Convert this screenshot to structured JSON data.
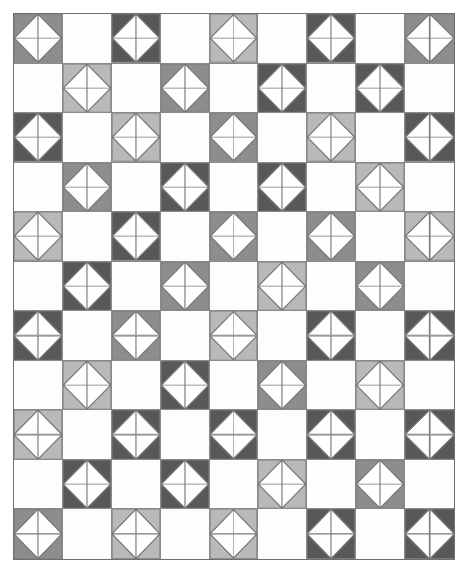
{
  "artwork": {
    "title": "Patchwork quilt pattern",
    "description": "Checkerboard layout of half-square-triangle quilt blocks forming white diamonds on a grid",
    "canvas": {
      "width": 467,
      "height": 572,
      "background": "#ffffff"
    }
  },
  "frame": {
    "x": 13,
    "y": 13,
    "width": 442,
    "height": 547,
    "border_color": "#6f6f6f",
    "fill": "#fdfdfc"
  },
  "grid": {
    "columns": 9,
    "rows": 11,
    "line_color": "#8a8a8a",
    "cell_fill": "#fdfdfc"
  },
  "palette": {
    "dark": "#585858",
    "medium": "#8d8d8d",
    "light": "#b9b9b9",
    "white": "#fefefe",
    "outline": "#7a7a7a"
  },
  "block_design": {
    "name": "half-square-triangle diamond block",
    "quadrants": 4,
    "corner_triangle_colored": true,
    "center_shape": "white diamond"
  },
  "chart_data": {
    "type": "heatmap",
    "xlabel": "",
    "ylabel": "",
    "columns": 9,
    "rows": 11,
    "legend": [
      "dark",
      "medium",
      "light",
      "empty"
    ],
    "note": "Each value is the shade key of the quilt block in that cell; empty cells are plain white squares.",
    "cells": [
      [
        "medium",
        "",
        "dark",
        "",
        "light",
        "",
        "dark",
        "",
        "medium"
      ],
      [
        "",
        "light",
        "",
        "medium",
        "",
        "dark",
        "",
        "dark",
        ""
      ],
      [
        "dark",
        "",
        "light",
        "",
        "medium",
        "",
        "light",
        "",
        "dark"
      ],
      [
        "",
        "medium",
        "",
        "dark",
        "",
        "dark",
        "",
        "light",
        ""
      ],
      [
        "light",
        "",
        "dark",
        "",
        "medium",
        "",
        "medium",
        "",
        "light"
      ],
      [
        "",
        "dark",
        "",
        "medium",
        "",
        "light",
        "",
        "medium",
        ""
      ],
      [
        "dark",
        "",
        "medium",
        "",
        "light",
        "",
        "dark",
        "",
        "dark"
      ],
      [
        "",
        "light",
        "",
        "dark",
        "",
        "medium",
        "",
        "light",
        ""
      ],
      [
        "light",
        "",
        "dark",
        "",
        "dark",
        "",
        "dark",
        "",
        "dark"
      ],
      [
        "",
        "dark",
        "",
        "dark",
        "",
        "light",
        "",
        "medium",
        ""
      ],
      [
        "medium",
        "",
        "light",
        "",
        "light",
        "",
        "dark",
        "",
        "dark"
      ]
    ]
  }
}
